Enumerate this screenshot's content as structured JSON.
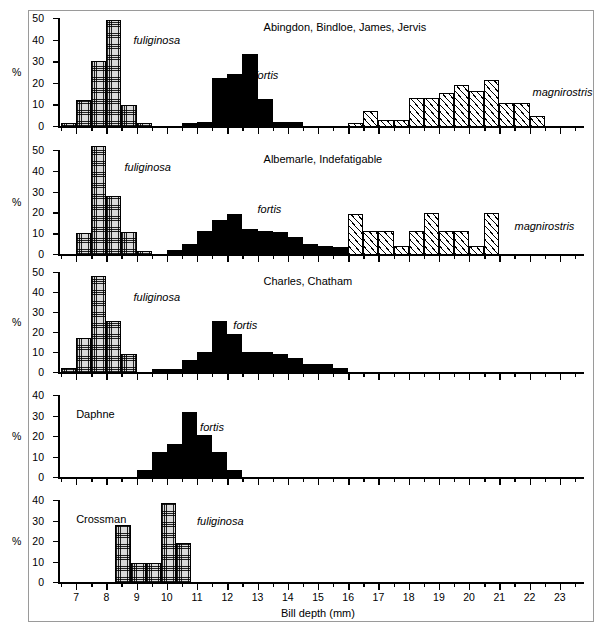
{
  "figure": {
    "xlabel": "Bill depth (mm)",
    "ylabel": "%",
    "xlim": [
      6.4,
      23.8
    ],
    "xticks_major": [
      7,
      8,
      9,
      10,
      11,
      12,
      13,
      14,
      15,
      16,
      17,
      18,
      19,
      20,
      21,
      22,
      23
    ],
    "bin_width": 0.5
  },
  "chart_data": {
    "type": "bar",
    "xlabel": "Bill depth (mm)",
    "ylabel": "%",
    "xlim": [
      6.4,
      23.8
    ],
    "bin_width": 0.5,
    "grid": false,
    "legend_position": "inline-annotations",
    "panels": [
      {
        "title": "Abingdon, Bindloe, James, Jervis",
        "ylim": [
          0,
          50
        ],
        "yticks": [
          0,
          10,
          20,
          30,
          40,
          50
        ],
        "series": [
          {
            "name": "fuliginosa",
            "fill": "cross-hatch",
            "label_x": 8.9,
            "label_y": 42,
            "bins": [
              6.5,
              7.0,
              7.5,
              8.0,
              8.5,
              9.0
            ],
            "values": [
              1.5,
              12.0,
              30.0,
              49.0,
              9.5,
              1.5
            ]
          },
          {
            "name": "fortis",
            "fill": "solid-black",
            "label_x": 12.9,
            "label_y": 26,
            "bins": [
              10.5,
              11.0,
              11.5,
              12.0,
              12.5,
              13.0,
              13.5,
              14.0
            ],
            "values": [
              1.5,
              2.0,
              22.0,
              24.0,
              33.5,
              12.5,
              2.0,
              2.0
            ]
          },
          {
            "name": "magnirostris",
            "fill": "diagonal-hatch",
            "label_x": 22.1,
            "label_y": 18,
            "bins": [
              15.5,
              16.0,
              16.5,
              17.0,
              17.5,
              18.0,
              18.5,
              19.0,
              19.5,
              20.0,
              20.5,
              21.0,
              21.5,
              22.0
            ],
            "values": [
              0.0,
              1.5,
              7.0,
              3.0,
              3.0,
              13.0,
              13.0,
              15.5,
              19.0,
              16.0,
              21.5,
              10.5,
              10.5,
              4.5
            ]
          }
        ]
      },
      {
        "title": "Albemarle, Indefatigable",
        "ylim": [
          0,
          50
        ],
        "yticks": [
          0,
          10,
          20,
          30,
          40,
          50
        ],
        "series": [
          {
            "name": "fuliginosa",
            "fill": "cross-hatch",
            "label_x": 8.6,
            "label_y": 44,
            "bins": [
              7.0,
              7.5,
              8.0,
              8.5,
              9.0
            ],
            "values": [
              10.0,
              52.0,
              28.0,
              10.5,
              1.5
            ]
          },
          {
            "name": "fortis",
            "fill": "solid-black",
            "label_x": 13.0,
            "label_y": 24,
            "bins": [
              10.0,
              10.5,
              11.0,
              11.5,
              12.0,
              12.5,
              13.0,
              13.5,
              14.0,
              14.5,
              15.0,
              15.5,
              16.0
            ],
            "values": [
              2.0,
              5.0,
              11.0,
              16.5,
              19.0,
              12.0,
              11.0,
              10.5,
              8.0,
              5.0,
              4.0,
              3.5,
              0.0
            ]
          },
          {
            "name": "magnirostris",
            "fill": "diagonal-hatch",
            "label_x": 21.5,
            "label_y": 16,
            "bins": [
              16.0,
              16.5,
              17.0,
              17.5,
              18.0,
              18.5,
              19.0,
              19.5,
              20.0,
              20.5,
              21.0
            ],
            "values": [
              19.0,
              11.0,
              11.0,
              4.0,
              11.0,
              19.5,
              11.0,
              11.0,
              4.0,
              19.5,
              0.0
            ]
          }
        ]
      },
      {
        "title": "Charles, Chatham",
        "ylim": [
          0,
          50
        ],
        "yticks": [
          0,
          10,
          20,
          30,
          40,
          50
        ],
        "series": [
          {
            "name": "fuliginosa",
            "fill": "cross-hatch",
            "label_x": 8.9,
            "label_y": 40,
            "bins": [
              6.5,
              7.0,
              7.5,
              8.0,
              8.5
            ],
            "values": [
              2.0,
              17.0,
              48.0,
              25.5,
              9.0
            ]
          },
          {
            "name": "fortis",
            "fill": "solid-black",
            "label_x": 12.2,
            "label_y": 26,
            "bins": [
              9.5,
              10.0,
              10.5,
              11.0,
              11.5,
              12.0,
              12.5,
              13.0,
              13.5,
              14.0,
              14.5,
              15.0,
              15.5
            ],
            "values": [
              1.5,
              1.5,
              6.0,
              10.0,
              25.5,
              19.0,
              10.0,
              10.0,
              9.0,
              7.0,
              4.0,
              4.0,
              2.0
            ]
          }
        ]
      },
      {
        "title": "Daphne",
        "ylim": [
          0,
          40
        ],
        "yticks": [
          0,
          10,
          20,
          30,
          40
        ],
        "series": [
          {
            "name": "fortis",
            "fill": "solid-black",
            "label_x": 11.1,
            "label_y": 27,
            "bins": [
              9.0,
              9.5,
              10.0,
              10.5,
              11.0,
              11.5,
              12.0
            ],
            "values": [
              3.5,
              12.0,
              16.0,
              31.5,
              20.5,
              12.0,
              3.5
            ]
          }
        ]
      },
      {
        "title": "Crossman",
        "ylim": [
          0,
          40
        ],
        "yticks": [
          0,
          10,
          20,
          30,
          40
        ],
        "series": [
          {
            "name": "fuliginosa",
            "fill": "cross-hatch",
            "label_x": 11.0,
            "label_y": 32,
            "bins": [
              8.3,
              8.8,
              9.3,
              9.8,
              10.3
            ],
            "values": [
              28.0,
              9.5,
              9.5,
              38.5,
              19.0
            ]
          }
        ]
      }
    ]
  }
}
